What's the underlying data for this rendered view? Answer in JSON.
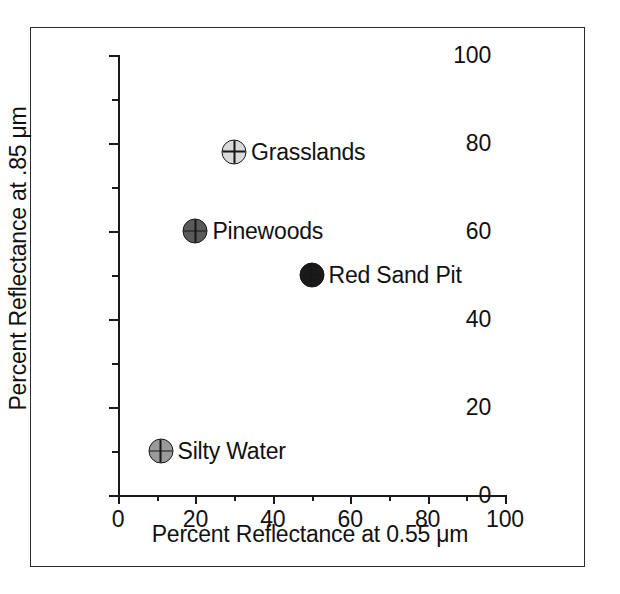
{
  "chart_data": {
    "type": "scatter",
    "title": "",
    "xlabel": "Percent Reflectance at 0.55 μm",
    "ylabel": "Percent Reflectance at .85 μm",
    "xlim": [
      0,
      100
    ],
    "ylim": [
      0,
      100
    ],
    "xticks": [
      0,
      20,
      40,
      60,
      80,
      100
    ],
    "yticks": [
      0,
      20,
      40,
      60,
      80,
      100
    ],
    "xtick_labels": [
      "0",
      "20",
      "40",
      "60",
      "80",
      "100"
    ],
    "ytick_labels": [
      "0",
      "20",
      "40",
      "60",
      "80",
      "100"
    ],
    "minor_xticks": [
      10,
      30,
      50,
      70,
      90
    ],
    "minor_yticks": [
      10,
      30,
      50,
      70,
      90
    ],
    "grid": false,
    "legend": "none",
    "points": [
      {
        "label": "Grasslands",
        "x": 30,
        "y": 78,
        "fill": "#d9d9d9",
        "marker": "crosshair-circle"
      },
      {
        "label": "Pinewoods",
        "x": 20,
        "y": 60,
        "fill": "#5a5a5a",
        "marker": "crosshair-circle"
      },
      {
        "label": "Red Sand Pit",
        "x": 50,
        "y": 50,
        "fill": "#1a1a1a",
        "marker": "crosshair-circle"
      },
      {
        "label": "Silty Water",
        "x": 11,
        "y": 10,
        "fill": "#9a9a9a",
        "marker": "crosshair-circle"
      }
    ]
  },
  "axis_titles": {
    "x": "Percent Reflectance at 0.55 μm",
    "y": "Percent Reflectance at .85 μm"
  },
  "colors": {
    "axis": "#1a1a1a",
    "frame": "#2b2b2b",
    "background": "#ffffff",
    "text": "#111111"
  }
}
